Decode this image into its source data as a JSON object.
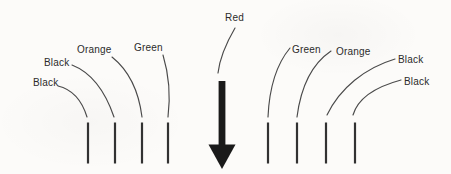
{
  "diagram": {
    "left_wires": [
      {
        "label": "Black"
      },
      {
        "label": "Black"
      },
      {
        "label": "Orange"
      },
      {
        "label": "Green"
      }
    ],
    "center_wire": {
      "label": "Red"
    },
    "right_wires": [
      {
        "label": "Green"
      },
      {
        "label": "Orange"
      },
      {
        "label": "Black"
      },
      {
        "label": "Black"
      }
    ],
    "colors": {
      "background": "#fcfbf9",
      "leader_line": "#4a4a4a",
      "wire_stub": "#323232",
      "arrow": "#1a1a1a",
      "text": "#2b2b2b"
    }
  }
}
